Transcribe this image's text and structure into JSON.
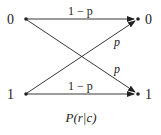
{
  "diagram": {
    "inputs": [
      "0",
      "1"
    ],
    "outputs": [
      "0",
      "1"
    ],
    "edges": [
      {
        "from": "0",
        "to": "0",
        "label": "1 − p"
      },
      {
        "from": "0",
        "to": "1",
        "label": "p"
      },
      {
        "from": "1",
        "to": "0",
        "label": "p"
      },
      {
        "from": "1",
        "to": "1",
        "label": "1 − p"
      }
    ],
    "caption": "P(r|c)",
    "caption_parts": {
      "P": "P",
      "open": "(",
      "r": "r",
      "bar": "|",
      "c": "c",
      "close": ")"
    }
  }
}
